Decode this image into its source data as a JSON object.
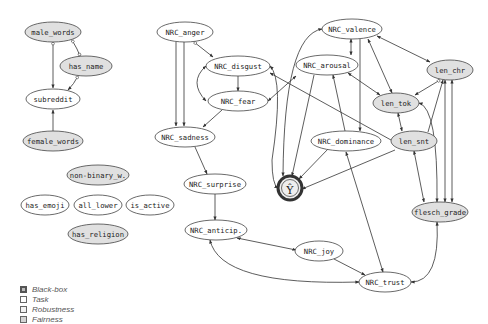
{
  "diagram": {
    "colors": {
      "white": "#ffffff",
      "gray": "#e0e0e0",
      "edge": "#333333",
      "stroke": "#444444"
    },
    "nodes": [
      {
        "id": "male_words",
        "label": "male_words",
        "x": 53,
        "y": 32,
        "rx": 28,
        "ry": 10,
        "type": "fairness"
      },
      {
        "id": "has_name",
        "label": "has_name",
        "x": 86,
        "y": 66,
        "rx": 26,
        "ry": 10,
        "type": "fairness"
      },
      {
        "id": "subreddit",
        "label": "subreddit",
        "x": 53,
        "y": 99,
        "rx": 27,
        "ry": 10,
        "type": "task"
      },
      {
        "id": "female_words",
        "label": "female_words",
        "x": 53,
        "y": 141,
        "rx": 30,
        "ry": 10,
        "type": "fairness"
      },
      {
        "id": "non_binary",
        "label": "non-binary_w.",
        "x": 98,
        "y": 175,
        "rx": 31,
        "ry": 10,
        "type": "fairness"
      },
      {
        "id": "has_emoji",
        "label": "has_emoji",
        "x": 45,
        "y": 205,
        "rx": 24,
        "ry": 10,
        "type": "task"
      },
      {
        "id": "all_lower",
        "label": "all_lower",
        "x": 98,
        "y": 205,
        "rx": 24,
        "ry": 10,
        "type": "task"
      },
      {
        "id": "is_active",
        "label": "is_active",
        "x": 150,
        "y": 205,
        "rx": 24,
        "ry": 10,
        "type": "task"
      },
      {
        "id": "has_religion",
        "label": "has_religion",
        "x": 98,
        "y": 234,
        "rx": 30,
        "ry": 10,
        "type": "fairness"
      },
      {
        "id": "NRC_anger",
        "label": "NRC_anger",
        "x": 185,
        "y": 32,
        "rx": 28,
        "ry": 10,
        "type": "task"
      },
      {
        "id": "NRC_disgust",
        "label": "NRC_disgust",
        "x": 238,
        "y": 66,
        "rx": 32,
        "ry": 10,
        "type": "task"
      },
      {
        "id": "NRC_fear",
        "label": "NRC_fear",
        "x": 238,
        "y": 101,
        "rx": 30,
        "ry": 10,
        "type": "task"
      },
      {
        "id": "NRC_sadness",
        "label": "NRC_sadness",
        "x": 185,
        "y": 137,
        "rx": 30,
        "ry": 10,
        "type": "task"
      },
      {
        "id": "NRC_surprise",
        "label": "NRC_surprise",
        "x": 215,
        "y": 184,
        "rx": 31,
        "ry": 10,
        "type": "task"
      },
      {
        "id": "NRC_anticip",
        "label": "NRC_anticip.",
        "x": 216,
        "y": 230,
        "rx": 31,
        "ry": 10,
        "type": "task"
      },
      {
        "id": "NRC_joy",
        "label": "NRC_joy",
        "x": 319,
        "y": 251,
        "rx": 24,
        "ry": 10,
        "type": "task"
      },
      {
        "id": "NRC_trust",
        "label": "NRC_trust",
        "x": 385,
        "y": 282,
        "rx": 26,
        "ry": 10,
        "type": "task"
      },
      {
        "id": "NRC_valence",
        "label": "NRC_valence",
        "x": 352,
        "y": 29,
        "rx": 30,
        "ry": 10,
        "type": "task"
      },
      {
        "id": "NRC_arousal",
        "label": "NRC_arousal",
        "x": 327,
        "y": 65,
        "rx": 31,
        "ry": 10,
        "type": "task"
      },
      {
        "id": "NRC_dominance",
        "label": "NRC_dominance",
        "x": 346,
        "y": 141,
        "rx": 35,
        "ry": 10,
        "type": "task"
      },
      {
        "id": "len_chr",
        "label": "len_chr",
        "x": 450,
        "y": 70,
        "rx": 23,
        "ry": 10,
        "type": "fairness"
      },
      {
        "id": "len_tok",
        "label": "len_tok",
        "x": 396,
        "y": 103,
        "rx": 23,
        "ry": 10,
        "type": "fairness"
      },
      {
        "id": "len_snt",
        "label": "len_snt",
        "x": 414,
        "y": 141,
        "rx": 23,
        "ry": 10,
        "type": "fairness"
      },
      {
        "id": "flesch_grade",
        "label": "flesch_grade",
        "x": 440,
        "y": 212,
        "rx": 28,
        "ry": 10,
        "type": "fairness"
      },
      {
        "id": "y_hat",
        "label": "Ŷ",
        "x": 290,
        "y": 188,
        "r": 12,
        "type": "blackbox"
      }
    ]
  },
  "legend": {
    "items": [
      {
        "label": "Black-box",
        "swatch": "#bbbbbb",
        "thick": true
      },
      {
        "label": "Task",
        "swatch": "#ffffff",
        "thick": false
      },
      {
        "label": "Robustness",
        "swatch": "#f2f2f2",
        "thick": false
      },
      {
        "label": "Fairness",
        "swatch": "#d4d4d4",
        "thick": false
      }
    ]
  }
}
